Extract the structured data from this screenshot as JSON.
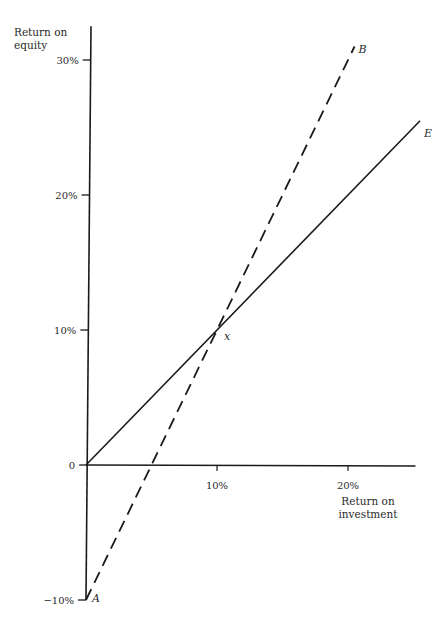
{
  "chart_data": {
    "type": "line",
    "title": "",
    "xlabel": "Return on investment",
    "xlabel_lines": [
      "Return on",
      "investment"
    ],
    "ylabel": "Return on equity",
    "ylabel_lines": [
      "Return on",
      "equity"
    ],
    "xlim": [
      0,
      25
    ],
    "ylim": [
      -10,
      32.5
    ],
    "x_ticks": [
      {
        "value": 10,
        "label": "10%"
      },
      {
        "value": 20,
        "label": "20%"
      }
    ],
    "y_ticks": [
      {
        "value": 30,
        "label": "30%"
      },
      {
        "value": 20,
        "label": "20%"
      },
      {
        "value": 10,
        "label": "10%"
      },
      {
        "value": 0,
        "label": "0"
      },
      {
        "value": -10,
        "label": "−10%"
      }
    ],
    "grid": false,
    "legend": "none",
    "series": [
      {
        "name": "E",
        "style": "solid",
        "x": [
          0,
          25.5
        ],
        "y": [
          0,
          25.5
        ],
        "end_label": "E"
      },
      {
        "name": "B",
        "style": "dashed",
        "x": [
          0,
          20.5
        ],
        "y": [
          -10,
          31
        ],
        "start_label": "A",
        "end_label": "B"
      }
    ],
    "annotations": [
      {
        "text": "x",
        "x": 10,
        "y": 10,
        "note": "intersection"
      }
    ],
    "colors": {
      "line": "#1a1a1a",
      "text": "#2a2a2a"
    }
  }
}
